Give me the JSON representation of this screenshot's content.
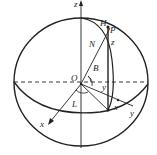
{
  "diagram": {
    "type": "geodetic-ellipsoid-coordinates",
    "colors": {
      "stroke": "#222222",
      "background": "#ffffff"
    },
    "labels": {
      "z_axis": "z",
      "H": "H",
      "P": "P",
      "N": "N",
      "z_small": "z",
      "B": "B",
      "O": "O",
      "y_angle": "y",
      "L": "L",
      "x_axis": "x",
      "x_small": "x",
      "y_axis": "y"
    }
  }
}
